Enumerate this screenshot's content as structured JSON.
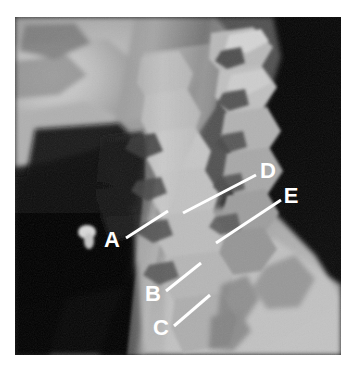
{
  "figure": {
    "kind": "radiograph",
    "modality": "X-ray",
    "view": "lateral cervical spine",
    "background_color": "#ffffff",
    "frame": {
      "x": 15,
      "y": 17,
      "width": 326,
      "height": 338
    }
  },
  "annotations": {
    "line_color": "#ffffff",
    "label_color": "#ffffff",
    "items": [
      {
        "id": "A",
        "label": "A",
        "label_x": 112,
        "label_y": 241,
        "line_start_x": 126,
        "line_start_y": 238,
        "line_end_x": 168,
        "line_end_y": 211
      },
      {
        "id": "B",
        "label": "B",
        "label_x": 153,
        "label_y": 295,
        "line_start_x": 166,
        "line_start_y": 291,
        "line_end_x": 201,
        "line_end_y": 263
      },
      {
        "id": "C",
        "label": "C",
        "label_x": 161,
        "label_y": 329,
        "line_start_x": 174,
        "line_start_y": 326,
        "line_end_x": 210,
        "line_end_y": 295
      },
      {
        "id": "D",
        "label": "D",
        "label_x": 268,
        "label_y": 172,
        "line_start_x": 183,
        "line_start_y": 213,
        "line_end_x": 256,
        "line_end_y": 175
      },
      {
        "id": "E",
        "label": "E",
        "label_x": 291,
        "label_y": 197,
        "line_start_x": 216,
        "line_start_y": 243,
        "line_end_x": 281,
        "line_end_y": 200
      }
    ]
  },
  "tones": {
    "film_dark": "#060606",
    "air_black": "#101010",
    "soft_tissue_mid": "#6d6d6d",
    "soft_tissue_light": "#9a9a9a",
    "bone_bright": "#c9c9c9",
    "bone_brightest": "#e0e0e0",
    "shoulder_light": "#b9b9b9"
  }
}
